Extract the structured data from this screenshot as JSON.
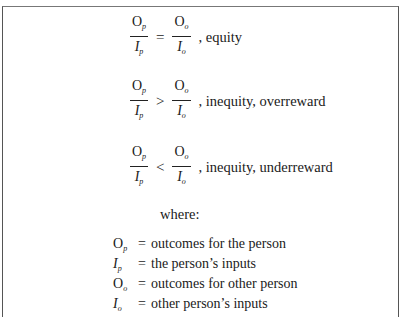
{
  "figure": {
    "equations": [
      {
        "left": {
          "num": "O",
          "num_sub": "p",
          "den": "I",
          "den_sub": "p"
        },
        "relation": "=",
        "right": {
          "num": "O",
          "num_sub": "o",
          "den": "I",
          "den_sub": "o"
        },
        "label": ", equity"
      },
      {
        "left": {
          "num": "O",
          "num_sub": "p",
          "den": "I",
          "den_sub": "p"
        },
        "relation": ">",
        "right": {
          "num": "O",
          "num_sub": "o",
          "den": "I",
          "den_sub": "o"
        },
        "label": ", inequity, overreward"
      },
      {
        "left": {
          "num": "O",
          "num_sub": "p",
          "den": "I",
          "den_sub": "p"
        },
        "relation": "<",
        "right": {
          "num": "O",
          "num_sub": "o",
          "den": "I",
          "den_sub": "o"
        },
        "label": ", inequity, underreward"
      }
    ],
    "where_label": "where:",
    "definitions": [
      {
        "symbol": "O",
        "sub": "p",
        "italic": false,
        "eq": "=",
        "text": "outcomes for the person"
      },
      {
        "symbol": "I",
        "sub": "p",
        "italic": true,
        "eq": "=",
        "text": "the person’s inputs"
      },
      {
        "symbol": "O",
        "sub": "o",
        "italic": false,
        "eq": "=",
        "text": "outcomes for other person"
      },
      {
        "symbol": "I",
        "sub": "o",
        "italic": true,
        "eq": "=",
        "text": "other person’s inputs"
      }
    ]
  }
}
